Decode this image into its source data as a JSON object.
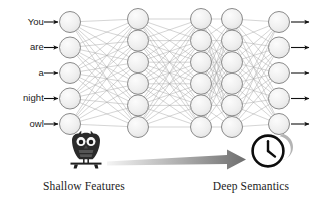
{
  "figure": {
    "background_color": "#ffffff"
  },
  "input_sequence": {
    "tokens": [
      "You",
      "are",
      "a",
      "night",
      "owl"
    ],
    "arrow_icon": "arrow-right-icon"
  },
  "network": {
    "node_fill": "#ededed",
    "node_stroke": "#8a8a8a",
    "edge_color": "#9a9a9a",
    "layers": [
      {
        "name": "input-layer",
        "node_count": 5,
        "cx": 70,
        "cy_start": 22,
        "cy_step": 25.5,
        "r": 10.5
      },
      {
        "name": "hidden-layer-1",
        "node_count": 6,
        "cx": 138,
        "cy_start": 19,
        "cy_step": 21.6,
        "r": 10.5
      },
      {
        "name": "hidden-layer-2",
        "node_count": 6,
        "cx": 201,
        "cy_start": 19,
        "cy_step": 21.6,
        "r": 10.5
      },
      {
        "name": "hidden-layer-3",
        "node_count": 6,
        "cx": 232,
        "cy_start": 19,
        "cy_step": 21.6,
        "r": 10.5
      },
      {
        "name": "output-layer",
        "node_count": 5,
        "cx": 279,
        "cy_start": 22,
        "cy_step": 25.5,
        "r": 10.5
      }
    ],
    "output_arrow_icon": "arrow-right-icon"
  },
  "stages": {
    "shallow": {
      "icon": "owl-icon",
      "caption": "Shallow Features",
      "caption_x": 36,
      "caption_y": 180
    },
    "deep": {
      "icon": "clock-moon-icon",
      "caption": "Deep Semantics",
      "caption_x": 196,
      "caption_y": 180
    },
    "transition_arrow": {
      "icon": "gradient-arrow-right-icon",
      "gradient_from": "#f2f2f2",
      "gradient_to": "#6e6e6e"
    }
  }
}
